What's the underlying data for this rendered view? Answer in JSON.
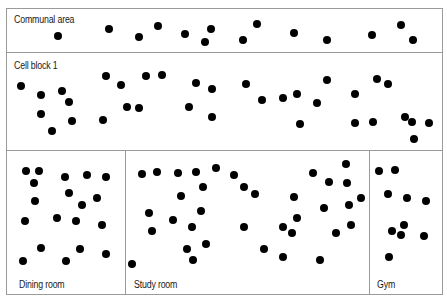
{
  "diagram": {
    "dot_color": "#000000",
    "border_color": "#9a9a9a",
    "zones": [
      {
        "id": "communal-area",
        "label": "Communal area",
        "box": {
          "x": 6,
          "y": 8,
          "w": 437,
          "h": 45
        },
        "label_pos": {
          "x": 14,
          "y": 14
        },
        "dots": [
          [
            58,
            36
          ],
          [
            109,
            29
          ],
          [
            139,
            37
          ],
          [
            158,
            26
          ],
          [
            185,
            34
          ],
          [
            205,
            42
          ],
          [
            211,
            29
          ],
          [
            243,
            40
          ],
          [
            257,
            24
          ],
          [
            294,
            33
          ],
          [
            327,
            40
          ],
          [
            372,
            35
          ],
          [
            401,
            25
          ],
          [
            413,
            40
          ]
        ]
      },
      {
        "id": "cell-block-1",
        "label": "Cell block 1",
        "box": {
          "x": 6,
          "y": 52,
          "w": 437,
          "h": 99
        },
        "label_pos": {
          "x": 14,
          "y": 60
        },
        "dots": [
          [
            21,
            86
          ],
          [
            41,
            95
          ],
          [
            41,
            114
          ],
          [
            52,
            131
          ],
          [
            62,
            91
          ],
          [
            69,
            102
          ],
          [
            72,
            121
          ],
          [
            103,
            120
          ],
          [
            106,
            76
          ],
          [
            121,
            85
          ],
          [
            127,
            107
          ],
          [
            139,
            108
          ],
          [
            146,
            76
          ],
          [
            162,
            75
          ],
          [
            189,
            107
          ],
          [
            196,
            83
          ],
          [
            212,
            89
          ],
          [
            212,
            117
          ],
          [
            246,
            84
          ],
          [
            262,
            100
          ],
          [
            283,
            98
          ],
          [
            297,
            94
          ],
          [
            300,
            124
          ],
          [
            317,
            103
          ],
          [
            327,
            80
          ],
          [
            355,
            94
          ],
          [
            355,
            123
          ],
          [
            373,
            122
          ],
          [
            377,
            79
          ],
          [
            388,
            84
          ],
          [
            405,
            117
          ],
          [
            412,
            122
          ],
          [
            414,
            139
          ],
          [
            429,
            123
          ]
        ]
      },
      {
        "id": "dining-room",
        "label": "Dining room",
        "box": {
          "x": 6,
          "y": 150,
          "w": 120,
          "h": 145
        },
        "label_pos": {
          "x": 19,
          "y": 279
        },
        "dots": [
          [
            26,
            171
          ],
          [
            39,
            171
          ],
          [
            34,
            183
          ],
          [
            65,
            177
          ],
          [
            87,
            175
          ],
          [
            106,
            177
          ],
          [
            69,
            193
          ],
          [
            35,
            201
          ],
          [
            97,
            198
          ],
          [
            82,
            205
          ],
          [
            25,
            221
          ],
          [
            57,
            218
          ],
          [
            76,
            221
          ],
          [
            102,
            225
          ],
          [
            41,
            248
          ],
          [
            80,
            249
          ],
          [
            106,
            254
          ],
          [
            23,
            261
          ],
          [
            66,
            261
          ]
        ]
      },
      {
        "id": "study-room",
        "label": "Study room",
        "box": {
          "x": 125,
          "y": 150,
          "w": 245,
          "h": 145
        },
        "label_pos": {
          "x": 134,
          "y": 279
        },
        "dots": [
          [
            142,
            174
          ],
          [
            157,
            172
          ],
          [
            178,
            173
          ],
          [
            196,
            172
          ],
          [
            216,
            168
          ],
          [
            234,
            175
          ],
          [
            203,
            187
          ],
          [
            244,
            187
          ],
          [
            255,
            194
          ],
          [
            181,
            196
          ],
          [
            294,
            197
          ],
          [
            149,
            213
          ],
          [
            173,
            220
          ],
          [
            201,
            211
          ],
          [
            192,
            227
          ],
          [
            152,
            231
          ],
          [
            244,
            227
          ],
          [
            283,
            227
          ],
          [
            292,
            233
          ],
          [
            297,
            218
          ],
          [
            264,
            249
          ],
          [
            187,
            249
          ],
          [
            206,
            244
          ],
          [
            283,
            257
          ],
          [
            193,
            260
          ],
          [
            132,
            264
          ],
          [
            346,
            164
          ],
          [
            313,
            173
          ],
          [
            329,
            182
          ],
          [
            347,
            183
          ],
          [
            361,
            198
          ],
          [
            324,
            208
          ],
          [
            349,
            205
          ],
          [
            351,
            225
          ],
          [
            336,
            233
          ],
          [
            320,
            260
          ]
        ]
      },
      {
        "id": "gym",
        "label": "Gym",
        "box": {
          "x": 369,
          "y": 150,
          "w": 74,
          "h": 145
        },
        "label_pos": {
          "x": 377,
          "y": 279
        },
        "dots": [
          [
            379,
            171
          ],
          [
            395,
            170
          ],
          [
            388,
            194
          ],
          [
            407,
            198
          ],
          [
            426,
            201
          ],
          [
            404,
            225
          ],
          [
            392,
            231
          ],
          [
            401,
            235
          ],
          [
            424,
            236
          ],
          [
            389,
            257
          ]
        ]
      }
    ]
  }
}
